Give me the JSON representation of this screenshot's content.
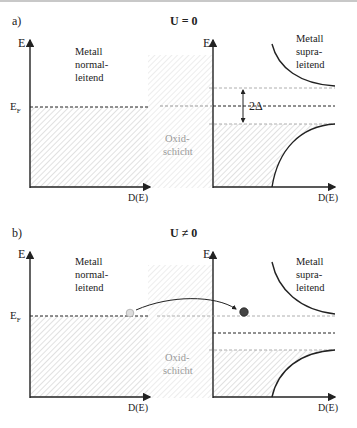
{
  "panels": [
    {
      "label": "a)",
      "title": "U = 0",
      "left": {
        "axis_y": "E",
        "axis_x": "D(E)",
        "fermi": "E",
        "fermi_sub": "F",
        "text": [
          "Metall",
          "normal-",
          "leitend"
        ]
      },
      "barrier": {
        "text": [
          "Oxid-",
          "schicht"
        ]
      },
      "right": {
        "axis_y": "E",
        "axis_x": "D(E)",
        "gap": "2Δ",
        "text": [
          "Metall",
          "supra-",
          "leitend"
        ]
      }
    },
    {
      "label": "b)",
      "title": "U ≠ 0",
      "left": {
        "axis_y": "E",
        "axis_x": "D(E)",
        "fermi": "E",
        "fermi_sub": "F",
        "text": [
          "Metall",
          "normal-",
          "leitend"
        ]
      },
      "barrier": {
        "text": [
          "Oxid-",
          "schicht"
        ]
      },
      "right": {
        "axis_y": "E",
        "axis_x": "D(E)",
        "text": [
          "Metall",
          "supra-",
          "leitend"
        ]
      }
    }
  ],
  "colors": {
    "line": "#222222",
    "hatch": "#bbbbbb",
    "barrier_text": "#999999",
    "electron_empty": "#dddddd",
    "electron_full": "#444444"
  }
}
